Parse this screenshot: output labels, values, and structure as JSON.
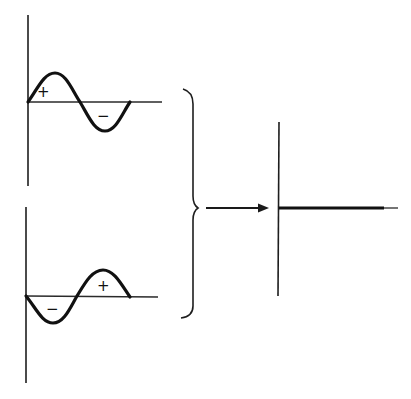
{
  "diagram": {
    "top_wave": {
      "label_positive": "+",
      "label_negative": "−",
      "phase": "starts positive"
    },
    "bottom_wave": {
      "label_positive": "+",
      "label_negative": "−",
      "phase": "starts negative"
    },
    "result": {
      "description": "flat line at zero amplitude"
    },
    "colors": {
      "ink": "#111111",
      "background": "#ffffff"
    }
  }
}
